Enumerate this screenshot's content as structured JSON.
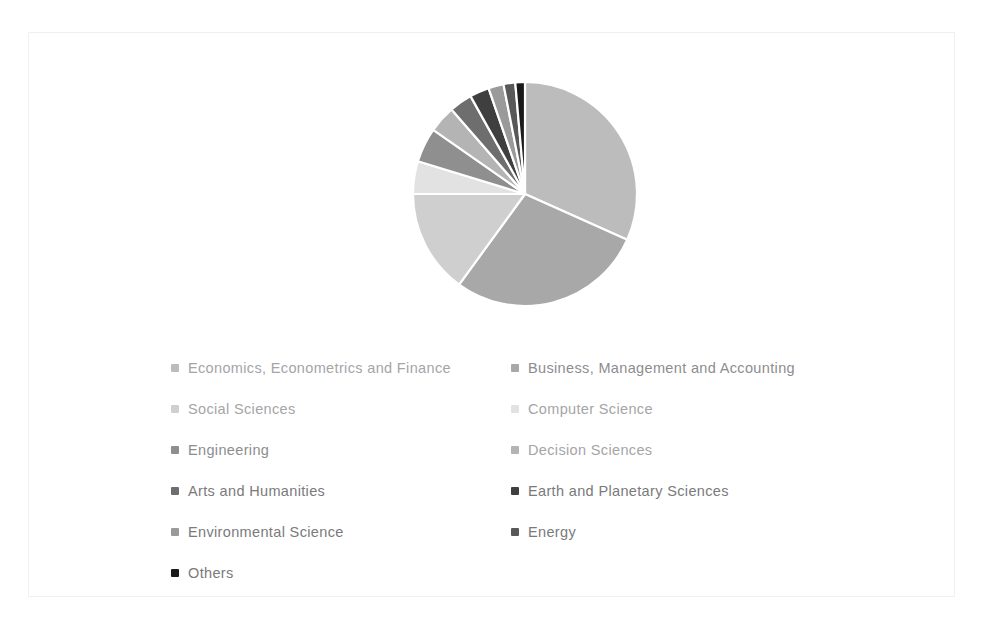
{
  "figure": {
    "type": "pie-chart",
    "background_color": "#ffffff",
    "border_color": "#f0f0f2"
  },
  "chart_data": {
    "type": "pie",
    "title": "",
    "subtitle": "",
    "xlabel": "",
    "ylabel": "",
    "grid": false,
    "legend_position": "bottom",
    "legend_columns": 2,
    "start_angle_deg": 0,
    "direction": "clockwise",
    "center": {
      "x": 495,
      "y": 190
    },
    "radius": 112,
    "categories": [
      "Economics, Econometrics and Finance",
      "Business, Management and Accounting",
      "Social Sciences",
      "Computer Science",
      "Engineering",
      "Decision Sciences",
      "Arts and Humanities",
      "Earth and Planetary Sciences",
      "Environmental Science",
      "Energy",
      "Others"
    ],
    "values": [
      31.7,
      28.3,
      15.0,
      4.7,
      5.0,
      3.9,
      3.3,
      2.8,
      2.2,
      1.7,
      1.4
    ],
    "unit": "percent",
    "slice_angles_deg": [
      114.1,
      101.9,
      54.0,
      16.9,
      18.0,
      14.0,
      11.9,
      10.1,
      7.9,
      6.1,
      5.0
    ],
    "colors": [
      "#bcbcbc",
      "#a8a8a8",
      "#cfcfcf",
      "#e2e2e2",
      "#8f8f8f",
      "#b4b4b4",
      "#6e6e6e",
      "#3f3f3f",
      "#9a9a9a",
      "#585858",
      "#1a1a1a"
    ]
  },
  "legend": {
    "left_column": [
      {
        "label": "Economics, Econometrics and Finance",
        "swatch": "#bcbcbc",
        "tone": "light"
      },
      {
        "label": "Social Sciences",
        "swatch": "#cfcfcf",
        "tone": "light"
      },
      {
        "label": "Engineering",
        "swatch": "#8f8f8f",
        "tone": ""
      },
      {
        "label": "Arts and Humanities",
        "swatch": "#6e6e6e",
        "tone": "dark"
      },
      {
        "label": "Environmental Science",
        "swatch": "#9a9a9a",
        "tone": "dark"
      },
      {
        "label": "Others",
        "swatch": "#1a1a1a",
        "tone": "dark"
      }
    ],
    "right_column": [
      {
        "label": "Business, Management and Accounting",
        "swatch": "#a8a8a8",
        "tone": ""
      },
      {
        "label": "Computer Science",
        "swatch": "#e2e2e2",
        "tone": "light"
      },
      {
        "label": "Decision Sciences",
        "swatch": "#b4b4b4",
        "tone": "light"
      },
      {
        "label": "Earth and Planetary Sciences",
        "swatch": "#3f3f3f",
        "tone": "dark"
      },
      {
        "label": "Energy",
        "swatch": "#585858",
        "tone": "dark"
      }
    ]
  }
}
